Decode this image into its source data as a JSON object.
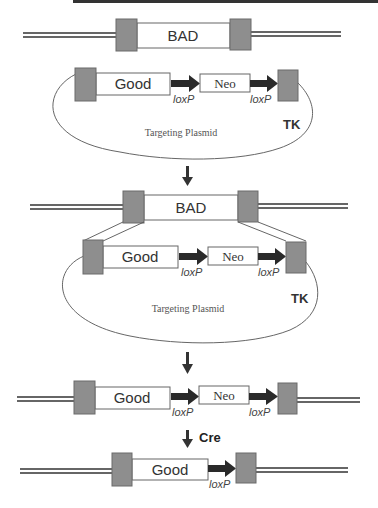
{
  "diagram": {
    "type": "gene-targeting-cre-lox",
    "rows": {
      "endogenous_locus": {
        "gene_label": "BAD"
      },
      "targeting_plasmid_1": {
        "good_label": "Good",
        "neo_label": "Neo",
        "loxp_1": "loxP",
        "loxp_2": "loxP",
        "plasmid_label": "Targeting Plasmid",
        "tk_label": "TK"
      },
      "recombination_locus": {
        "gene_label": "BAD"
      },
      "targeting_plasmid_2": {
        "good_label": "Good",
        "neo_label": "Neo",
        "loxp_1": "loxP",
        "loxp_2": "loxP",
        "plasmid_label": "Targeting Plasmid",
        "tk_label": "TK"
      },
      "targeted_allele": {
        "good_label": "Good",
        "neo_label": "Neo",
        "loxp_1": "loxP",
        "loxp_2": "loxP"
      },
      "cre_step": {
        "label": "Cre"
      },
      "final_allele": {
        "good_label": "Good",
        "loxp_1": "loxP"
      }
    },
    "colors": {
      "homology_arm": "#8e8e8e",
      "arrow": "#2a2a2a",
      "dna_line": "#333333",
      "background": "#ffffff"
    }
  }
}
